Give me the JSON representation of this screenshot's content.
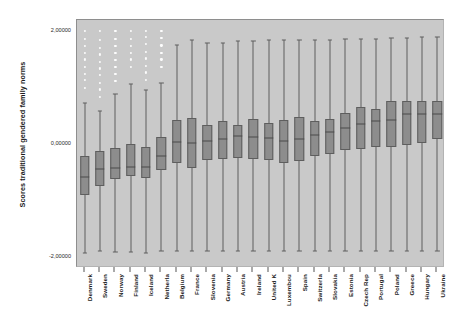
{
  "chart": {
    "type": "box",
    "ylabel": "Scores traditional gendered family norms",
    "yticklabels": [
      "2,00000",
      "0,00000",
      "-2,00000"
    ],
    "ytickvalues": [
      2,
      0,
      -2
    ],
    "ylim": [
      -2.2,
      2.2
    ],
    "grid": false,
    "legend": false,
    "title": "",
    "xlabel": "",
    "colors": {
      "plot_background": "#c9c9c9",
      "box_fill": "#8d8d8d",
      "box_edge": "#5e5e5e",
      "median": "#4a4a4a",
      "outlier": "#fdfdfd",
      "figure_background": "#ffffff"
    }
  },
  "chart_data": {
    "type": "box",
    "title": "",
    "xlabel": "",
    "ylabel": "Scores traditional gendered family norms",
    "ylim": [
      -2.2,
      2.2
    ],
    "ytick_labels": [
      "2,00000",
      "0,00000",
      "-2,00000"
    ],
    "ytick_values": [
      2,
      0,
      -2
    ],
    "grid": false,
    "legend_position": "none",
    "categories": [
      "Denmark",
      "Sweden",
      "Norway",
      "Finland",
      "Iceland",
      "Netherla",
      "Belgium",
      "France",
      "Slovenia",
      "Germany",
      "Austria",
      "Ireland",
      "United K",
      "Luxembou",
      "Spain",
      "Switzerla",
      "Slovakia",
      "Estonia",
      "Czech Rep",
      "Portugal",
      "Poland",
      "Greece",
      "Hungary",
      "Ukraine"
    ],
    "boxes": [
      {
        "category": "Denmark",
        "whisker_low": -1.93,
        "q1": -0.9,
        "median": -0.58,
        "q3": -0.21,
        "whisker_high": 0.73,
        "outliers": [
          1.0,
          1.13,
          1.25,
          1.37,
          1.5,
          1.62,
          1.74,
          1.86,
          2.0
        ]
      },
      {
        "category": "Sweden",
        "whisker_low": -1.9,
        "q1": -0.74,
        "median": -0.44,
        "q3": -0.12,
        "whisker_high": 0.58,
        "outliers": [
          0.84,
          0.97,
          1.09,
          1.22,
          1.34,
          1.46,
          1.59,
          1.71,
          1.85,
          2.0
        ]
      },
      {
        "category": "Norway",
        "whisker_low": -1.91,
        "q1": -0.62,
        "median": -0.42,
        "q3": -0.07,
        "whisker_high": 0.89,
        "outliers": [
          1.12,
          1.25,
          1.37,
          1.49,
          1.62,
          1.74,
          1.87,
          2.0
        ]
      },
      {
        "category": "Finland",
        "whisker_low": -1.91,
        "q1": -0.57,
        "median": -0.41,
        "q3": 0.0,
        "whisker_high": 1.07,
        "outliers": [
          1.37,
          1.5,
          1.62,
          1.74,
          1.87,
          2.0
        ]
      },
      {
        "category": "Iceland",
        "whisker_low": -1.93,
        "q1": -0.6,
        "median": -0.4,
        "q3": -0.05,
        "whisker_high": 0.95,
        "outliers": [
          1.14,
          1.27,
          1.39,
          1.52,
          1.64,
          1.77,
          1.9,
          2.0
        ]
      },
      {
        "category": "Netherla",
        "whisker_low": -1.9,
        "q1": -0.46,
        "median": -0.22,
        "q3": 0.13,
        "whisker_high": 1.09,
        "outliers": [
          1.37,
          1.5,
          1.62,
          1.75,
          1.88,
          2.0
        ]
      },
      {
        "category": "Belgium",
        "whisker_low": -1.9,
        "q1": -0.33,
        "median": 0.03,
        "q3": 0.43,
        "whisker_high": 1.75,
        "outliers": []
      },
      {
        "category": "France",
        "whisker_low": -1.89,
        "q1": -0.42,
        "median": 0.02,
        "q3": 0.47,
        "whisker_high": 1.85,
        "outliers": []
      },
      {
        "category": "Slovenia",
        "whisker_low": -1.9,
        "q1": -0.28,
        "median": 0.05,
        "q3": 0.33,
        "whisker_high": 1.8,
        "outliers": []
      },
      {
        "category": "Germany",
        "whisker_low": -1.89,
        "q1": -0.27,
        "median": 0.08,
        "q3": 0.4,
        "whisker_high": 1.8,
        "outliers": []
      },
      {
        "category": "Austria",
        "whisker_low": -1.89,
        "q1": -0.25,
        "median": 0.14,
        "q3": 0.33,
        "whisker_high": 1.82,
        "outliers": []
      },
      {
        "category": "Ireland",
        "whisker_low": -1.89,
        "q1": -0.26,
        "median": 0.12,
        "q3": 0.44,
        "whisker_high": 1.82,
        "outliers": []
      },
      {
        "category": "United K",
        "whisker_low": -1.89,
        "q1": -0.29,
        "median": 0.11,
        "q3": 0.37,
        "whisker_high": 1.85,
        "outliers": []
      },
      {
        "category": "Luxembou",
        "whisker_low": -1.89,
        "q1": -0.33,
        "median": 0.06,
        "q3": 0.42,
        "whisker_high": 1.85,
        "outliers": []
      },
      {
        "category": "Spain",
        "whisker_low": -1.89,
        "q1": -0.3,
        "median": 0.09,
        "q3": 0.48,
        "whisker_high": 1.85,
        "outliers": []
      },
      {
        "category": "Switzerla",
        "whisker_low": -1.89,
        "q1": -0.21,
        "median": 0.16,
        "q3": 0.41,
        "whisker_high": 1.85,
        "outliers": []
      },
      {
        "category": "Slovakia",
        "whisker_low": -1.89,
        "q1": -0.18,
        "median": 0.21,
        "q3": 0.45,
        "whisker_high": 1.85,
        "outliers": []
      },
      {
        "category": "Estonia",
        "whisker_low": -1.89,
        "q1": -0.1,
        "median": 0.29,
        "q3": 0.55,
        "whisker_high": 1.86,
        "outliers": []
      },
      {
        "category": "Czech Rep",
        "whisker_low": -1.89,
        "q1": -0.09,
        "median": 0.35,
        "q3": 0.66,
        "whisker_high": 1.87,
        "outliers": []
      },
      {
        "category": "Portugal",
        "whisker_low": -1.89,
        "q1": -0.05,
        "median": 0.41,
        "q3": 0.62,
        "whisker_high": 1.87,
        "outliers": []
      },
      {
        "category": "Poland",
        "whisker_low": -1.89,
        "q1": -0.06,
        "median": 0.43,
        "q3": 0.76,
        "whisker_high": 1.88,
        "outliers": []
      },
      {
        "category": "Greece",
        "whisker_low": -1.89,
        "q1": -0.02,
        "median": 0.54,
        "q3": 0.76,
        "whisker_high": 1.88,
        "outliers": []
      },
      {
        "category": "Hungary",
        "whisker_low": -1.89,
        "q1": 0.01,
        "median": 0.54,
        "q3": 0.76,
        "whisker_high": 1.89,
        "outliers": []
      },
      {
        "category": "Ukraine",
        "whisker_low": -1.89,
        "q1": 0.09,
        "median": 0.53,
        "q3": 0.76,
        "whisker_high": 1.89,
        "outliers": []
      }
    ]
  }
}
